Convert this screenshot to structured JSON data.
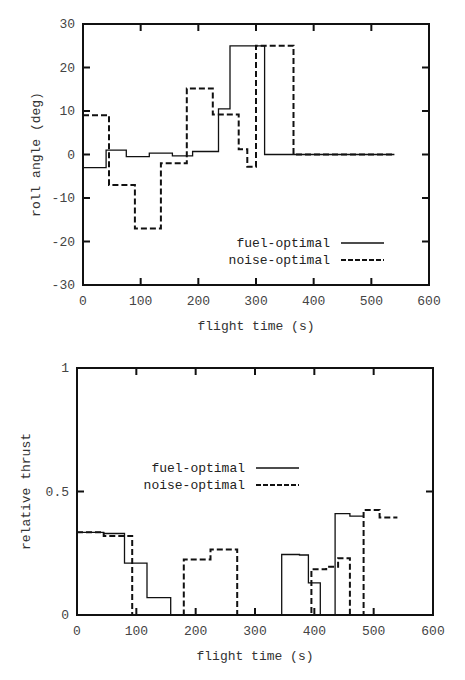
{
  "chart_data": [
    {
      "type": "line",
      "step": true,
      "title": "",
      "xlabel": "flight time (s)",
      "ylabel": "roll angle (deg)",
      "xlim": [
        0,
        600
      ],
      "ylim": [
        -30,
        30
      ],
      "xticks": [
        0,
        100,
        200,
        300,
        400,
        500,
        600
      ],
      "yticks": [
        -30,
        -20,
        -10,
        0,
        10,
        20,
        30
      ],
      "grid": false,
      "legend_position": "lower right",
      "series": [
        {
          "name": "fuel-optimal",
          "style": "solid",
          "steps": [
            {
              "t0": 0,
              "t1": 40,
              "v": -3
            },
            {
              "t0": 40,
              "t1": 75,
              "v": 1
            },
            {
              "t0": 75,
              "t1": 115,
              "v": -0.5
            },
            {
              "t0": 115,
              "t1": 155,
              "v": 0.3
            },
            {
              "t0": 155,
              "t1": 190,
              "v": -0.3
            },
            {
              "t0": 190,
              "t1": 235,
              "v": 0.7
            },
            {
              "t0": 235,
              "t1": 255,
              "v": 10.5
            },
            {
              "t0": 255,
              "t1": 315,
              "v": 25
            },
            {
              "t0": 315,
              "t1": 540,
              "v": 0
            }
          ]
        },
        {
          "name": "noise-optimal",
          "style": "dashed",
          "steps": [
            {
              "t0": 0,
              "t1": 45,
              "v": 9
            },
            {
              "t0": 45,
              "t1": 90,
              "v": -7
            },
            {
              "t0": 90,
              "t1": 135,
              "v": -17
            },
            {
              "t0": 135,
              "t1": 180,
              "v": -2
            },
            {
              "t0": 180,
              "t1": 225,
              "v": 15.2
            },
            {
              "t0": 225,
              "t1": 270,
              "v": 9.2
            },
            {
              "t0": 270,
              "t1": 285,
              "v": 1.2
            },
            {
              "t0": 285,
              "t1": 300,
              "v": -2.8
            },
            {
              "t0": 300,
              "t1": 365,
              "v": 25
            },
            {
              "t0": 365,
              "t1": 540,
              "v": 0
            }
          ]
        }
      ]
    },
    {
      "type": "line",
      "step": true,
      "title": "",
      "xlabel": "flight time (s)",
      "ylabel": "relative thrust",
      "xlim": [
        0,
        600
      ],
      "ylim": [
        0,
        1
      ],
      "xticks": [
        0,
        100,
        200,
        300,
        400,
        500,
        600
      ],
      "yticks": [
        0,
        0.5,
        1
      ],
      "grid": false,
      "legend_position": "center left",
      "series": [
        {
          "name": "fuel-optimal",
          "style": "solid",
          "steps": [
            {
              "t0": 0,
              "t1": 45,
              "v": 0.335
            },
            {
              "t0": 45,
              "t1": 80,
              "v": 0.33
            },
            {
              "t0": 80,
              "t1": 118,
              "v": 0.21
            },
            {
              "t0": 118,
              "t1": 158,
              "v": 0.07
            },
            {
              "t0": 158,
              "t1": 345,
              "v": 0
            },
            {
              "t0": 345,
              "t1": 375,
              "v": 0.245
            },
            {
              "t0": 375,
              "t1": 390,
              "v": 0.243
            },
            {
              "t0": 390,
              "t1": 410,
              "v": 0.13
            },
            {
              "t0": 410,
              "t1": 435,
              "v": 0
            },
            {
              "t0": 435,
              "t1": 460,
              "v": 0.41
            },
            {
              "t0": 460,
              "t1": 482,
              "v": 0.4
            }
          ]
        },
        {
          "name": "noise-optimal",
          "style": "dashed",
          "steps": [
            {
              "t0": 0,
              "t1": 45,
              "v": 0.335
            },
            {
              "t0": 45,
              "t1": 93,
              "v": 0.32
            },
            {
              "t0": 93,
              "t1": 180,
              "v": 0
            },
            {
              "t0": 180,
              "t1": 225,
              "v": 0.225
            },
            {
              "t0": 225,
              "t1": 270,
              "v": 0.265
            },
            {
              "t0": 270,
              "t1": 395,
              "v": 0
            },
            {
              "t0": 395,
              "t1": 420,
              "v": 0.185
            },
            {
              "t0": 420,
              "t1": 440,
              "v": 0.195
            },
            {
              "t0": 440,
              "t1": 460,
              "v": 0.23
            },
            {
              "t0": 460,
              "t1": 483,
              "v": 0
            },
            {
              "t0": 483,
              "t1": 510,
              "v": 0.425
            },
            {
              "t0": 510,
              "t1": 540,
              "v": 0.395
            }
          ]
        }
      ]
    }
  ],
  "layout": {
    "plots": [
      {
        "left": 83,
        "right": 429,
        "top": 24,
        "bottom": 285,
        "xlabel_y": 330,
        "ylabel_x": 40,
        "legend": {
          "x": 330,
          "y": 243,
          "line_x1": 341,
          "line_x2": 384
        }
      },
      {
        "left": 77,
        "right": 433,
        "top": 368,
        "bottom": 615,
        "xlabel_y": 660,
        "ylabel_x": 30,
        "legend": {
          "x": 245,
          "y": 468,
          "line_x1": 256,
          "line_x2": 299
        }
      }
    ]
  }
}
